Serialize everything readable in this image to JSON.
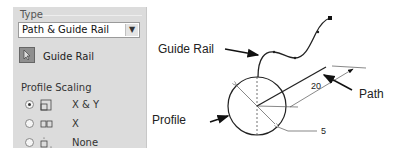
{
  "panel": {
    "type_group_label": "Type",
    "type_select": {
      "value": "Path & Guide Rail"
    },
    "guide_rail_button": {
      "label": "Guide Rail",
      "icon": "cursor-select-icon"
    },
    "profile_scaling": {
      "label": "Profile Scaling",
      "options": [
        {
          "label": "X & Y",
          "selected": true,
          "icon": "scale-xy-icon"
        },
        {
          "label": "X",
          "selected": false,
          "icon": "scale-x-icon"
        },
        {
          "label": "None",
          "selected": false,
          "icon": "scale-none-icon"
        }
      ]
    }
  },
  "diagram": {
    "labels": {
      "guide_rail": "Guide Rail",
      "path": "Path",
      "profile": "Profile"
    },
    "dimensions": {
      "path_length": "20",
      "profile_radius": "5"
    }
  }
}
